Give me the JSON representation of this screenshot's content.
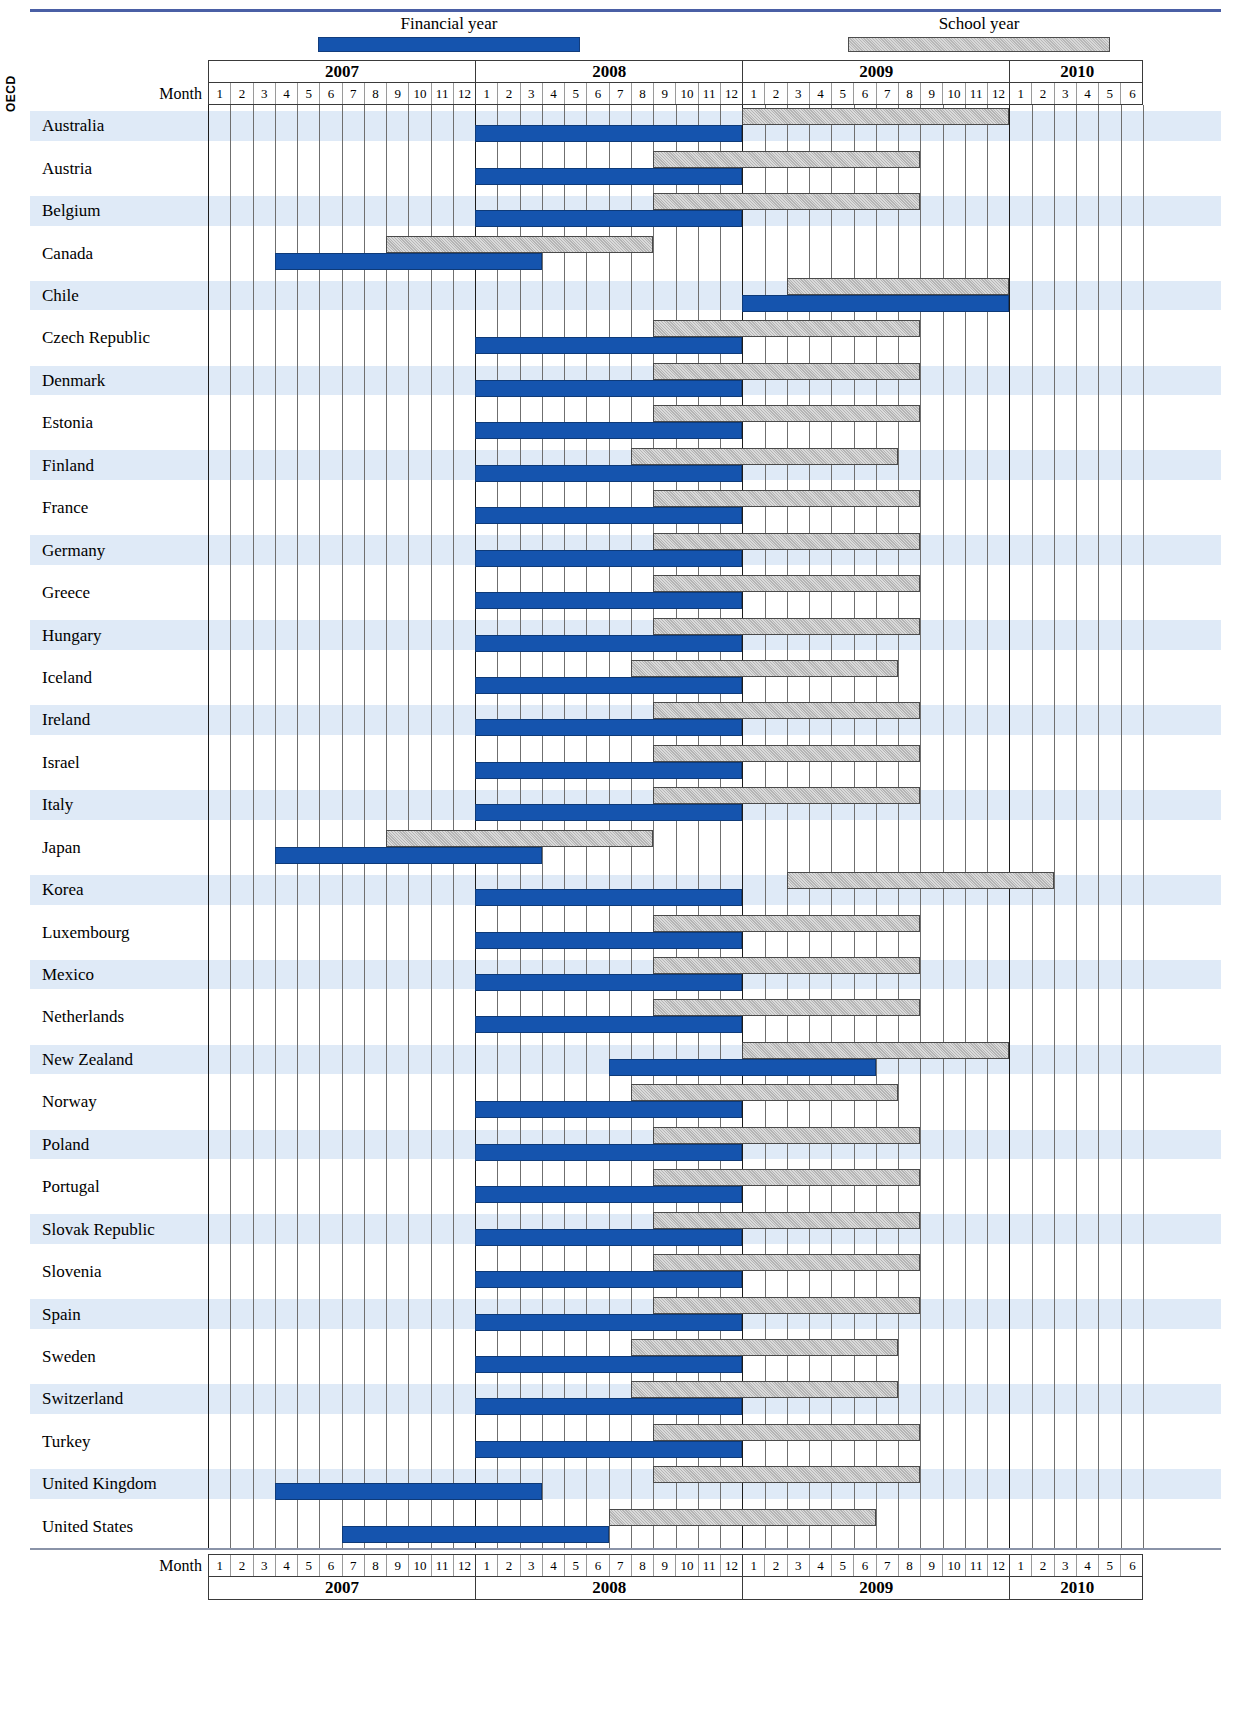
{
  "legend": {
    "financial_label": "Financial year",
    "school_label": "School year",
    "financial_color": "#1554ae",
    "school_color": "#b5b5b5"
  },
  "axis": {
    "month_label": "Month",
    "years": [
      {
        "label": "2007",
        "months": 12
      },
      {
        "label": "2008",
        "months": 12
      },
      {
        "label": "2009",
        "months": 12
      },
      {
        "label": "2010",
        "months": 6
      }
    ],
    "months": [
      1,
      2,
      3,
      4,
      5,
      6,
      7,
      8,
      9,
      10,
      11,
      12,
      1,
      2,
      3,
      4,
      5,
      6,
      7,
      8,
      9,
      10,
      11,
      12,
      1,
      2,
      3,
      4,
      5,
      6,
      7,
      8,
      9,
      10,
      11,
      12,
      1,
      2,
      3,
      4,
      5,
      6
    ],
    "start_year": 2007,
    "start_month": 1,
    "total_months": 42
  },
  "group_label": "OECD",
  "chart_data": {
    "type": "bar",
    "title": "",
    "xlabel": "Month",
    "ylabel": "",
    "legend_position": "top",
    "grid": true,
    "x_axis_months": 42,
    "x_axis_start": "2007-01",
    "x_axis_end": "2010-06",
    "series": [
      {
        "name": "Financial year",
        "color": "#1554ae"
      },
      {
        "name": "School year",
        "color": "#b5b5b5"
      }
    ],
    "categories": [
      "Australia",
      "Austria",
      "Belgium",
      "Canada",
      "Chile",
      "Czech Republic",
      "Denmark",
      "Estonia",
      " Finland",
      "France",
      "Germany",
      "Greece",
      "Hungary",
      "Iceland",
      "Ireland",
      "Israel",
      "Italy",
      "Japan",
      "Korea",
      "Luxembourg",
      "Mexico",
      "Netherlands",
      "New Zealand",
      "Norway",
      "Poland",
      "Portugal",
      "Slovak Republic",
      "Slovenia",
      "Spain",
      "Sweden",
      "Switzerland",
      "Turkey",
      "United Kingdom",
      "United States"
    ],
    "rows": [
      {
        "country": "Australia",
        "financial": {
          "start": 13,
          "end": 24
        },
        "school": {
          "start": 25,
          "end": 36
        }
      },
      {
        "country": "Austria",
        "financial": {
          "start": 13,
          "end": 24
        },
        "school": {
          "start": 21,
          "end": 32
        }
      },
      {
        "country": "Belgium",
        "financial": {
          "start": 13,
          "end": 24
        },
        "school": {
          "start": 21,
          "end": 32
        }
      },
      {
        "country": "Canada",
        "financial": {
          "start": 4,
          "end": 15
        },
        "school": {
          "start": 9,
          "end": 20
        }
      },
      {
        "country": "Chile",
        "financial": {
          "start": 25,
          "end": 36
        },
        "school": {
          "start": 27,
          "end": 36
        }
      },
      {
        "country": "Czech Republic",
        "financial": {
          "start": 13,
          "end": 24
        },
        "school": {
          "start": 21,
          "end": 32
        }
      },
      {
        "country": "Denmark",
        "financial": {
          "start": 13,
          "end": 24
        },
        "school": {
          "start": 21,
          "end": 32
        }
      },
      {
        "country": "Estonia",
        "financial": {
          "start": 13,
          "end": 24
        },
        "school": {
          "start": 21,
          "end": 32
        }
      },
      {
        "country": " Finland",
        "financial": {
          "start": 13,
          "end": 24
        },
        "school": {
          "start": 20,
          "end": 31
        }
      },
      {
        "country": "France",
        "financial": {
          "start": 13,
          "end": 24
        },
        "school": {
          "start": 21,
          "end": 32
        }
      },
      {
        "country": "Germany",
        "financial": {
          "start": 13,
          "end": 24
        },
        "school": {
          "start": 21,
          "end": 32
        }
      },
      {
        "country": "Greece",
        "financial": {
          "start": 13,
          "end": 24
        },
        "school": {
          "start": 21,
          "end": 32
        }
      },
      {
        "country": "Hungary",
        "financial": {
          "start": 13,
          "end": 24
        },
        "school": {
          "start": 21,
          "end": 32
        }
      },
      {
        "country": "Iceland",
        "financial": {
          "start": 13,
          "end": 24
        },
        "school": {
          "start": 20,
          "end": 31
        }
      },
      {
        "country": "Ireland",
        "financial": {
          "start": 13,
          "end": 24
        },
        "school": {
          "start": 21,
          "end": 32
        }
      },
      {
        "country": "Israel",
        "financial": {
          "start": 13,
          "end": 24
        },
        "school": {
          "start": 21,
          "end": 32
        }
      },
      {
        "country": "Italy",
        "financial": {
          "start": 13,
          "end": 24
        },
        "school": {
          "start": 21,
          "end": 32
        }
      },
      {
        "country": "Japan",
        "financial": {
          "start": 4,
          "end": 15
        },
        "school": {
          "start": 9,
          "end": 20
        }
      },
      {
        "country": "Korea",
        "financial": {
          "start": 13,
          "end": 24
        },
        "school": {
          "start": 27,
          "end": 38
        }
      },
      {
        "country": "Luxembourg",
        "financial": {
          "start": 13,
          "end": 24
        },
        "school": {
          "start": 21,
          "end": 32
        }
      },
      {
        "country": "Mexico",
        "financial": {
          "start": 13,
          "end": 24
        },
        "school": {
          "start": 21,
          "end": 32
        }
      },
      {
        "country": "Netherlands",
        "financial": {
          "start": 13,
          "end": 24
        },
        "school": {
          "start": 21,
          "end": 32
        }
      },
      {
        "country": "New Zealand",
        "financial": {
          "start": 19,
          "end": 30
        },
        "school": {
          "start": 25,
          "end": 36
        }
      },
      {
        "country": "Norway",
        "financial": {
          "start": 13,
          "end": 24
        },
        "school": {
          "start": 20,
          "end": 31
        }
      },
      {
        "country": "Poland",
        "financial": {
          "start": 13,
          "end": 24
        },
        "school": {
          "start": 21,
          "end": 32
        }
      },
      {
        "country": "Portugal",
        "financial": {
          "start": 13,
          "end": 24
        },
        "school": {
          "start": 21,
          "end": 32
        }
      },
      {
        "country": "Slovak Republic",
        "financial": {
          "start": 13,
          "end": 24
        },
        "school": {
          "start": 21,
          "end": 32
        }
      },
      {
        "country": "Slovenia",
        "financial": {
          "start": 13,
          "end": 24
        },
        "school": {
          "start": 21,
          "end": 32
        }
      },
      {
        "country": "Spain",
        "financial": {
          "start": 13,
          "end": 24
        },
        "school": {
          "start": 21,
          "end": 32
        }
      },
      {
        "country": "Sweden",
        "financial": {
          "start": 13,
          "end": 24
        },
        "school": {
          "start": 20,
          "end": 31
        }
      },
      {
        "country": "Switzerland",
        "financial": {
          "start": 13,
          "end": 24
        },
        "school": {
          "start": 20,
          "end": 31
        }
      },
      {
        "country": "Turkey",
        "financial": {
          "start": 13,
          "end": 24
        },
        "school": {
          "start": 21,
          "end": 32
        }
      },
      {
        "country": "United Kingdom",
        "financial": {
          "start": 4,
          "end": 15
        },
        "school": {
          "start": 21,
          "end": 32
        }
      },
      {
        "country": "United States",
        "financial": {
          "start": 7,
          "end": 18
        },
        "school": {
          "start": 19,
          "end": 30
        }
      }
    ]
  }
}
